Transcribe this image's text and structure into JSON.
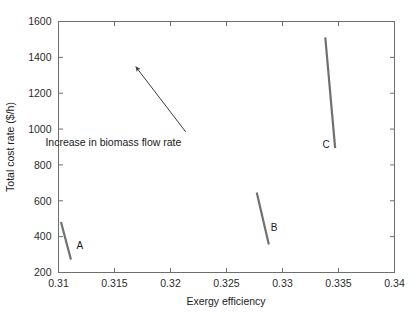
{
  "chart_data": {
    "type": "line",
    "title": "",
    "xlabel": "Exergy efficiency",
    "ylabel": "Total cost rate ($/h)",
    "xlim": [
      0.31,
      0.34
    ],
    "ylim": [
      200,
      1600
    ],
    "xticks": [
      0.31,
      0.315,
      0.32,
      0.325,
      0.33,
      0.335,
      0.34
    ],
    "xtick_labels": [
      "0.31",
      "0.315",
      "0.32",
      "0.325",
      "0.33",
      "0.335",
      "0.34"
    ],
    "yticks": [
      200,
      400,
      600,
      800,
      1000,
      1200,
      1400,
      1600
    ],
    "ytick_labels": [
      "200",
      "400",
      "600",
      "800",
      "1000",
      "1200",
      "1400",
      "1600"
    ],
    "grid": false,
    "legend": "none",
    "series_color": "#707070",
    "axis_color": "#6e6e6e",
    "series": [
      {
        "name": "A",
        "label": "A",
        "label_x": 0.3119,
        "label_y": 330,
        "points": [
          {
            "x": 0.31022,
            "y": 482
          },
          {
            "x": 0.31111,
            "y": 272
          }
        ]
      },
      {
        "name": "B",
        "label": "B",
        "label_x": 0.32925,
        "label_y": 432,
        "points": [
          {
            "x": 0.3277,
            "y": 646
          },
          {
            "x": 0.32878,
            "y": 356
          }
        ]
      },
      {
        "name": "C",
        "label": "C",
        "label_x": 0.3339,
        "label_y": 896,
        "points": [
          {
            "x": 0.33382,
            "y": 1512
          },
          {
            "x": 0.3347,
            "y": 894
          }
        ]
      }
    ],
    "annotations": [
      {
        "text": "Increase in biomass flow rate",
        "text_x": 0.3149,
        "text_y": 905,
        "arrow_tail_x": 0.32135,
        "arrow_tail_y": 985,
        "arrow_head_x": 0.3169,
        "arrow_head_y": 1348
      }
    ]
  }
}
